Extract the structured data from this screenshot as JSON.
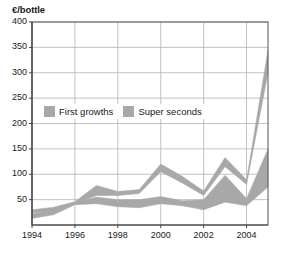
{
  "chart_data": {
    "type": "area",
    "title": "",
    "subtitle": "",
    "ylabel": "€/bottle",
    "xlabel": "",
    "x": [
      1994,
      1995,
      1996,
      1997,
      1998,
      1999,
      2000,
      2001,
      2002,
      2003,
      2004,
      2005
    ],
    "xtick_labels": [
      "1994",
      "1996",
      "1998",
      "2000",
      "2002",
      "2004"
    ],
    "xtick_values": [
      1994,
      1996,
      1998,
      2000,
      2002,
      2004
    ],
    "ytick_labels": [
      "400",
      "350",
      "300",
      "250",
      "200",
      "150",
      "100",
      "50"
    ],
    "ytick_values": [
      400,
      350,
      300,
      250,
      200,
      150,
      100,
      50
    ],
    "ylim": [
      0,
      400
    ],
    "xlim": [
      1994,
      2005
    ],
    "grid": true,
    "legend_position": "inside-upper-left",
    "band_color": "#a8a8a8",
    "grid_color": "#b4b4b4",
    "axis_color": "#555555",
    "text_color": "#1a1a1a",
    "series": [
      {
        "name": "First growths",
        "kind": "band",
        "upper": [
          30,
          35,
          46,
          78,
          66,
          70,
          120,
          96,
          67,
          133,
          89,
          345
        ],
        "lower": [
          24,
          27,
          42,
          58,
          58,
          62,
          105,
          83,
          58,
          115,
          80,
          300
        ]
      },
      {
        "name": "Super seconds",
        "kind": "band",
        "upper": [
          22,
          29,
          44,
          55,
          50,
          50,
          56,
          48,
          50,
          98,
          52,
          150
        ],
        "lower": [
          13,
          20,
          40,
          42,
          36,
          34,
          42,
          38,
          30,
          45,
          38,
          75
        ]
      }
    ]
  },
  "legend": {
    "entries": [
      {
        "label": "First growths",
        "color": "#a8a8a8"
      },
      {
        "label": "Super seconds",
        "color": "#a8a8a8"
      }
    ]
  }
}
